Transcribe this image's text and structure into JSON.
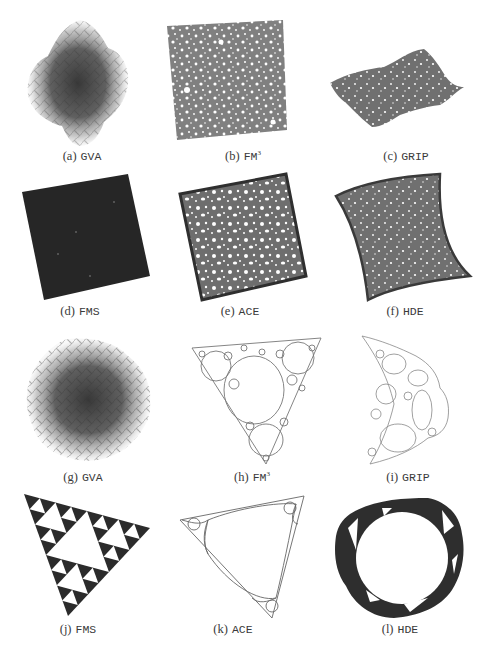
{
  "figure": {
    "panels": [
      {
        "id": "a",
        "label": "(a)",
        "method": "GVA",
        "superscript": "",
        "graph": "grid mesh",
        "style": "tangled blob"
      },
      {
        "id": "b",
        "label": "(b)",
        "method": "FM",
        "superscript": "3",
        "graph": "grid mesh",
        "style": "flat square with holes"
      },
      {
        "id": "c",
        "label": "(c)",
        "method": "GRIP",
        "superscript": "",
        "graph": "grid mesh",
        "style": "folded sheet"
      },
      {
        "id": "d",
        "label": "(d)",
        "method": "FMS",
        "superscript": "",
        "graph": "grid mesh",
        "style": "dense dark square"
      },
      {
        "id": "e",
        "label": "(e)",
        "method": "ACE",
        "superscript": "",
        "graph": "grid mesh",
        "style": "square with holes, dark rim"
      },
      {
        "id": "f",
        "label": "(f)",
        "method": "HDE",
        "superscript": "",
        "graph": "grid mesh",
        "style": "curved square with small holes"
      },
      {
        "id": "g",
        "label": "(g)",
        "method": "GVA",
        "superscript": "",
        "graph": "Sierpinski",
        "style": "tangled blob"
      },
      {
        "id": "h",
        "label": "(h)",
        "method": "FM",
        "superscript": "3",
        "graph": "Sierpinski",
        "style": "triangle with circular holes"
      },
      {
        "id": "i",
        "label": "(i)",
        "method": "GRIP",
        "superscript": "",
        "graph": "Sierpinski",
        "style": "folded crescent"
      },
      {
        "id": "j",
        "label": "(j)",
        "method": "FMS",
        "superscript": "",
        "graph": "Sierpinski",
        "style": "Sierpinski triangle"
      },
      {
        "id": "k",
        "label": "(k)",
        "method": "ACE",
        "superscript": "",
        "graph": "Sierpinski",
        "style": "thin rounded triangle"
      },
      {
        "id": "l",
        "label": "(l)",
        "method": "HDE",
        "superscript": "",
        "graph": "Sierpinski",
        "style": "ring of triangles"
      }
    ]
  },
  "colors": {
    "ink_dark": "#2a2a2a",
    "mesh_gray": "#7a7a7a",
    "caption": "#3a3a3a",
    "background": "#ffffff"
  }
}
